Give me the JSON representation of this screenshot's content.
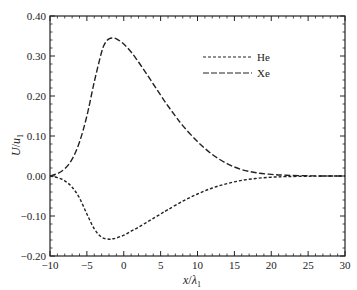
{
  "chart_data": {
    "type": "line",
    "title": "",
    "xlabel": "x/λ₁",
    "ylabel": "U/u₁",
    "xlim": [
      -10,
      30
    ],
    "ylim": [
      -0.2,
      0.4
    ],
    "xticks": [
      -10,
      -5,
      0,
      5,
      10,
      15,
      20,
      25,
      30
    ],
    "xtick_labels": [
      "−10",
      "−5",
      "0",
      "5",
      "10",
      "15",
      "20",
      "25",
      "30"
    ],
    "yticks": [
      -0.2,
      -0.1,
      0.0,
      0.1,
      0.2,
      0.3,
      0.4
    ],
    "ytick_labels": [
      "−0.20",
      "−0.10",
      "0.00",
      "0.10",
      "0.20",
      "0.30",
      "0.40"
    ],
    "grid": false,
    "legend_position": "upper right (inside)",
    "series": [
      {
        "name": "He",
        "style": "short-dash",
        "x": [
          -10,
          -9,
          -8,
          -7,
          -6,
          -5,
          -4,
          -3,
          -2,
          -1.5,
          -1,
          0,
          1,
          2,
          3,
          4,
          5,
          6,
          8,
          10,
          12,
          14,
          16,
          18,
          20,
          22,
          25,
          28,
          30
        ],
        "y": [
          0.0,
          -0.004,
          -0.012,
          -0.028,
          -0.055,
          -0.095,
          -0.132,
          -0.153,
          -0.158,
          -0.157,
          -0.155,
          -0.148,
          -0.138,
          -0.128,
          -0.117,
          -0.106,
          -0.095,
          -0.084,
          -0.063,
          -0.045,
          -0.03,
          -0.019,
          -0.011,
          -0.006,
          -0.003,
          -0.0015,
          -0.0005,
          0.0,
          0.0
        ]
      },
      {
        "name": "Xe",
        "style": "long-dash",
        "x": [
          -10,
          -9,
          -8,
          -7,
          -6,
          -5,
          -4,
          -3,
          -2.5,
          -2,
          -1.5,
          -1,
          0,
          1,
          2,
          3,
          4,
          5,
          6,
          7,
          8,
          10,
          12,
          14,
          16,
          18,
          20,
          22,
          25,
          28,
          30
        ],
        "y": [
          0.0,
          0.006,
          0.018,
          0.042,
          0.085,
          0.15,
          0.235,
          0.31,
          0.333,
          0.343,
          0.345,
          0.343,
          0.33,
          0.31,
          0.285,
          0.258,
          0.23,
          0.202,
          0.175,
          0.15,
          0.126,
          0.086,
          0.054,
          0.031,
          0.016,
          0.008,
          0.004,
          0.002,
          0.0005,
          0.0,
          0.0
        ]
      }
    ]
  },
  "legend": {
    "items": [
      {
        "label": "He"
      },
      {
        "label": "Xe"
      }
    ]
  },
  "axes": {
    "xlabel_var": "x",
    "xlabel_slash": "/",
    "xlabel_lambda": "λ",
    "xlabel_sub": "1",
    "ylabel_var": "U",
    "ylabel_slash": "/",
    "ylabel_u": "u",
    "ylabel_sub": "1"
  },
  "colors": {
    "line": "#222222",
    "axis": "#222222",
    "background": "#ffffff"
  }
}
